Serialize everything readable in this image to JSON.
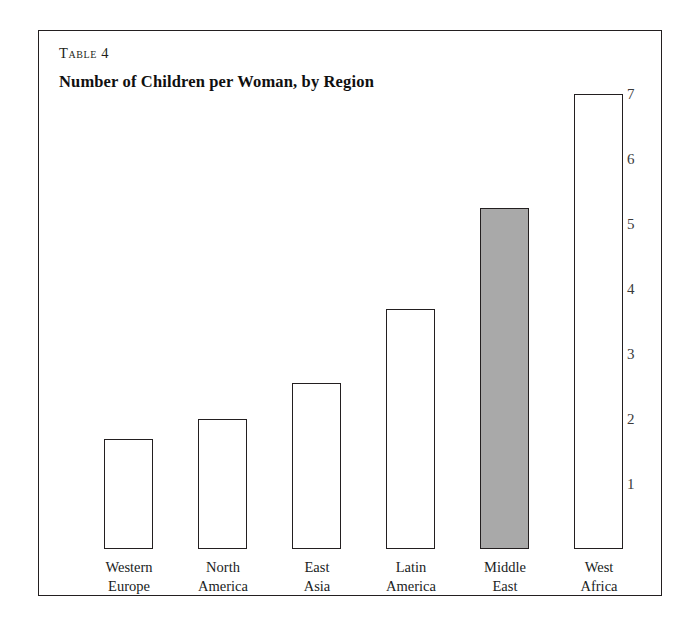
{
  "figure": {
    "table_number": "Table 4",
    "title": "Number of Children per Woman, by Region"
  },
  "colors": {
    "frame": "#231f20",
    "bar_outline": "#231f20",
    "bar_fill_default": "#ffffff",
    "bar_fill_highlight": "#a9a9a9",
    "text": "#201d1d",
    "tick_label": "#3a3a3a",
    "background": "#ffffff"
  },
  "chart_data": {
    "type": "bar",
    "title": "Number of Children per Woman, by Region",
    "subtitle": "Table 4",
    "xlabel": "",
    "ylabel": "",
    "ylim": [
      0,
      7.6
    ],
    "grid": false,
    "legend": "none",
    "axis_position": "right",
    "y_ticks": [
      7,
      6,
      5,
      4,
      3,
      2,
      1
    ],
    "categories": [
      "Western Europe",
      "North America",
      "East Asia",
      "Latin America",
      "Middle East",
      "West Africa"
    ],
    "category_lines": [
      [
        "Western",
        "Europe"
      ],
      [
        "North",
        "America"
      ],
      [
        "East",
        "Asia"
      ],
      [
        "Latin",
        "America"
      ],
      [
        "Middle",
        "East"
      ],
      [
        "West",
        "Africa"
      ]
    ],
    "values": [
      1.7,
      2.0,
      2.55,
      3.7,
      5.25,
      7.0
    ],
    "highlighted_category": "Middle East",
    "bars": [
      {
        "label": "Western Europe",
        "line1": "Western",
        "line2": "Europe",
        "value": 1.7,
        "highlight": false
      },
      {
        "label": "North America",
        "line1": "North",
        "line2": "America",
        "value": 2.0,
        "highlight": false
      },
      {
        "label": "East Asia",
        "line1": "East",
        "line2": "Asia",
        "value": 2.55,
        "highlight": false
      },
      {
        "label": "Latin America",
        "line1": "Latin",
        "line2": "America",
        "value": 3.7,
        "highlight": false
      },
      {
        "label": "Middle East",
        "line1": "Middle",
        "line2": "East",
        "value": 5.25,
        "highlight": true
      },
      {
        "label": "West Africa",
        "line1": "West",
        "line2": "Africa",
        "value": 7.0,
        "highlight": false
      }
    ]
  }
}
